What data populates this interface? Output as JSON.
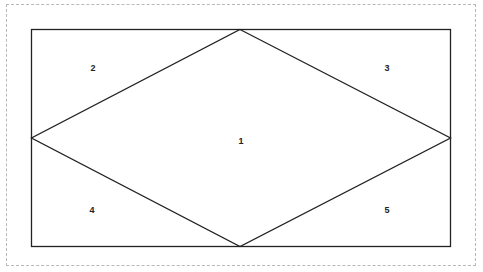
{
  "diagram": {
    "type": "rhombus-in-rectangle",
    "rectangle": {
      "x": 31,
      "y": 29,
      "width": 419,
      "height": 217
    },
    "rhombus": {
      "top": [
        240,
        29
      ],
      "right": [
        450,
        138
      ],
      "bottom": [
        240,
        246
      ],
      "left": [
        31,
        138
      ]
    },
    "stroke_color": "#222222",
    "regions": [
      {
        "id": "1",
        "label": "1",
        "x": 241,
        "y": 141
      },
      {
        "id": "2",
        "label": "2",
        "x": 93,
        "y": 68
      },
      {
        "id": "3",
        "label": "3",
        "x": 387,
        "y": 68
      },
      {
        "id": "4",
        "label": "4",
        "x": 92,
        "y": 210
      },
      {
        "id": "5",
        "label": "5",
        "x": 387,
        "y": 210
      }
    ]
  }
}
